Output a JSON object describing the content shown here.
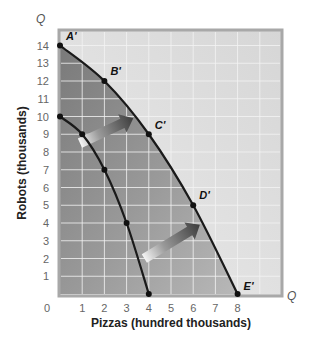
{
  "chart_data": {
    "type": "line",
    "title": "",
    "xlabel": "Pizzas (hundred thousands)",
    "ylabel": "Robots (thousands)",
    "x_axis_end_label": "Q",
    "y_axis_end_label": "Q",
    "xlim": [
      0,
      9
    ],
    "ylim": [
      0,
      15
    ],
    "x_ticks": [
      0,
      1,
      2,
      3,
      4,
      5,
      6,
      7,
      8
    ],
    "y_ticks": [
      1,
      2,
      3,
      4,
      5,
      6,
      7,
      8,
      9,
      10,
      11,
      12,
      13,
      14
    ],
    "grid": true,
    "series": [
      {
        "name": "Original PPF",
        "points": [
          {
            "x": 0,
            "y": 10
          },
          {
            "x": 1,
            "y": 9
          },
          {
            "x": 2,
            "y": 7
          },
          {
            "x": 3,
            "y": 4
          },
          {
            "x": 4,
            "y": 0
          }
        ]
      },
      {
        "name": "Shifted PPF",
        "points": [
          {
            "x": 0,
            "y": 14,
            "label": "A'"
          },
          {
            "x": 2,
            "y": 12,
            "label": "B'"
          },
          {
            "x": 4,
            "y": 9,
            "label": "C'"
          },
          {
            "x": 6,
            "y": 5,
            "label": "D'"
          },
          {
            "x": 8,
            "y": 0,
            "label": "E'"
          }
        ]
      }
    ],
    "annotations": [
      {
        "type": "arrow",
        "description": "outward shift arrow",
        "from": {
          "x": 0.9,
          "y": 8.5
        },
        "to": {
          "x": 3.3,
          "y": 9.9
        }
      },
      {
        "type": "arrow",
        "description": "outward shift arrow",
        "from": {
          "x": 3.8,
          "y": 2.0
        },
        "to": {
          "x": 6.3,
          "y": 3.9
        }
      }
    ],
    "colors": {
      "background_plot": "#dcdcdc",
      "shaded_region": "#8c8c8c",
      "gridline": "#f2f2f2",
      "curve": "#1a1a1a",
      "arrow": "#555555"
    }
  }
}
